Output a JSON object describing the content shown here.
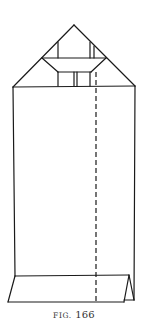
{
  "figure": {
    "caption_prefix": "FIG.",
    "caption_number": "166",
    "stroke_color": "#1a1a1a",
    "stroke_width": 1.2,
    "fold_line_dash": "5,3",
    "shapes": {
      "roof_left_edge": {
        "x1": 13,
        "y1": 87,
        "x2": 74,
        "y2": 25
      },
      "roof_right_edge": {
        "x1": 74,
        "y1": 25,
        "x2": 135,
        "y2": 86
      },
      "gable_inner_left": {
        "x1": 58,
        "y1": 42,
        "x2": 58,
        "y2": 58
      },
      "gable_inner_right": {
        "x1": 90,
        "y1": 42,
        "x2": 90,
        "y2": 58
      },
      "gable_inner_right2": {
        "x1": 94,
        "y1": 46,
        "x2": 94,
        "y2": 58
      },
      "band_top": {
        "x1": 42,
        "y1": 58,
        "x2": 106,
        "y2": 58
      },
      "band_left_slant": {
        "x1": 42,
        "y1": 58,
        "x2": 58,
        "y2": 72
      },
      "band_right_slant": {
        "x1": 106,
        "y1": 58,
        "x2": 91,
        "y2": 72
      },
      "band_bottom": {
        "x1": 58,
        "y1": 72,
        "x2": 91,
        "y2": 72
      },
      "window_left": {
        "x1": 58,
        "y1": 72,
        "x2": 58,
        "y2": 86
      },
      "window_mid_a": {
        "x1": 74,
        "y1": 72,
        "x2": 74,
        "y2": 86
      },
      "window_mid_b": {
        "x1": 77,
        "y1": 72,
        "x2": 77,
        "y2": 86
      },
      "window_right": {
        "x1": 90,
        "y1": 72,
        "x2": 90,
        "y2": 86
      },
      "body_top": {
        "x1": 13,
        "y1": 87,
        "x2": 135,
        "y2": 86
      },
      "body_left": {
        "x1": 13,
        "y1": 87,
        "x2": 15,
        "y2": 276
      },
      "body_right": {
        "x1": 135,
        "y1": 86,
        "x2": 134,
        "y2": 300
      },
      "base_top": {
        "x1": 15,
        "y1": 276,
        "x2": 129,
        "y2": 275
      },
      "base_left_slant": {
        "x1": 15,
        "y1": 276,
        "x2": 8,
        "y2": 302
      },
      "base_bottom": {
        "x1": 8,
        "y1": 302,
        "x2": 124,
        "y2": 302
      },
      "base_flap_left": {
        "x1": 124,
        "y1": 302,
        "x2": 129,
        "y2": 275
      },
      "base_flap_right": {
        "x1": 129,
        "y1": 275,
        "x2": 134,
        "y2": 300
      },
      "base_flap_bottom": {
        "x1": 124,
        "y1": 300,
        "x2": 134,
        "y2": 300
      }
    },
    "fold_line": {
      "x1": 96,
      "y1": 72,
      "x2": 96,
      "y2": 302
    }
  }
}
